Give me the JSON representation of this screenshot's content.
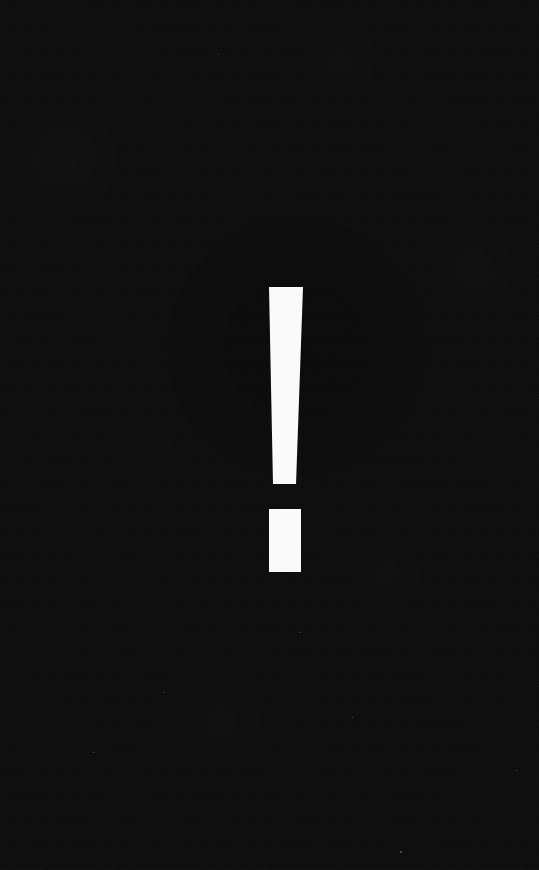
{
  "canvas": {
    "width": 539,
    "height": 870,
    "background_color": "#0d0d0d",
    "description": "Solid near-black textured background"
  },
  "glyph": {
    "name": "exclamation-mark",
    "character": "!",
    "color": "#fafafa",
    "alt_text": "Large white exclamation mark on a black background",
    "bounds": {
      "x": 269,
      "y": 287,
      "width": 34,
      "height": 285
    },
    "stem": {
      "top_y": 287,
      "bottom_y": 484,
      "top_left_x": 269,
      "top_right_x": 303,
      "bottom_left_x": 273,
      "bottom_right_x": 296,
      "top_width": 34,
      "bottom_width": 23
    },
    "gap": {
      "top_y": 484,
      "bottom_y": 509,
      "height": 25
    },
    "dot": {
      "x": 269,
      "y": 509,
      "width": 32,
      "height": 63,
      "shape": "rectangle"
    }
  },
  "specks": [
    {
      "x": 400,
      "y": 851,
      "size": 2
    },
    {
      "x": 299,
      "y": 632,
      "size": 1
    },
    {
      "x": 163,
      "y": 692,
      "size": 1
    },
    {
      "x": 352,
      "y": 717,
      "size": 1
    },
    {
      "x": 93,
      "y": 752,
      "size": 1
    },
    {
      "x": 516,
      "y": 770,
      "size": 1
    },
    {
      "x": 218,
      "y": 54,
      "size": 1
    }
  ]
}
